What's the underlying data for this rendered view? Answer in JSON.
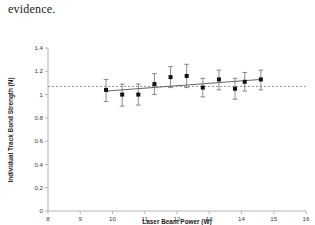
{
  "document": {
    "body_text": "evidence."
  },
  "chart_data": {
    "type": "scatter",
    "title": "",
    "xlabel": "Laser Beam Power (W)",
    "ylabel": "Individual Track Bond Strength (N)",
    "xlim": [
      8,
      16
    ],
    "ylim": [
      0,
      1.4
    ],
    "xticks": [
      8,
      9,
      10,
      11,
      12,
      13,
      14,
      15,
      16
    ],
    "xtick_labels": [
      "8",
      "9",
      "10",
      "11",
      "12",
      "13",
      "14",
      "15",
      "16"
    ],
    "yticks": [
      0,
      0.2,
      0.4,
      0.6,
      0.8,
      1,
      1.2,
      1.4
    ],
    "ytick_labels": [
      "0",
      "0.2",
      "0.4",
      "0.6",
      "0.8",
      "1",
      "1.2",
      "1.4"
    ],
    "grid": false,
    "legend": "none",
    "marker": "square",
    "marker_color": "#111111",
    "errorbar_color": "#6e6e6e",
    "x": [
      9.8,
      10.3,
      10.8,
      11.3,
      11.8,
      12.3,
      12.8,
      13.3,
      13.8,
      14.1,
      14.6
    ],
    "y": [
      1.04,
      1.0,
      1.0,
      1.09,
      1.15,
      1.16,
      1.06,
      1.13,
      1.05,
      1.11,
      1.13
    ],
    "yerr_low": [
      0.1,
      0.1,
      0.09,
      0.09,
      0.09,
      0.1,
      0.08,
      0.09,
      0.09,
      0.08,
      0.09
    ],
    "yerr_high": [
      0.09,
      0.09,
      0.09,
      0.09,
      0.09,
      0.1,
      0.08,
      0.08,
      0.09,
      0.08,
      0.08
    ],
    "reference_line": {
      "type": "horizontal-dashed",
      "y": 1.07,
      "color": "#8a8a8a"
    },
    "trend_line": {
      "type": "linear-fit",
      "x_start": 9.8,
      "x_end": 14.6,
      "y_start": 1.03,
      "y_end": 1.13,
      "color": "#555555"
    }
  }
}
